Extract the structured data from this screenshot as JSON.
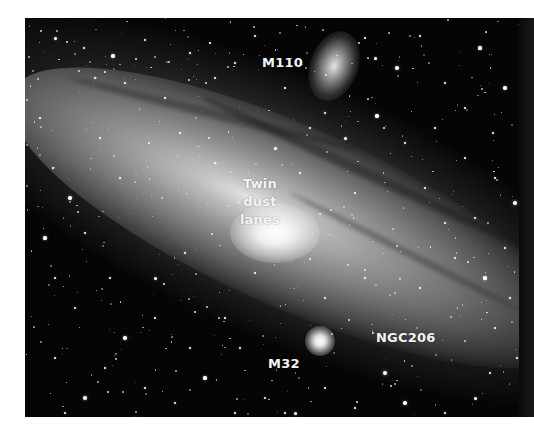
{
  "image": {
    "subject": "Andromeda galaxy (M31) with satellite galaxies",
    "style": "grayscale astrophotograph",
    "colors": {
      "background_page": "#ffffff",
      "sky": "#050505",
      "label_text": "#f4f4f4"
    }
  },
  "labels": {
    "m110": "M110",
    "twin_dust_lanes": [
      "Twin",
      "dust",
      "lanes"
    ],
    "ngc206": "NGC206",
    "m32": "M32"
  },
  "stars": [
    [
      30,
      20,
      1.5
    ],
    [
      59,
      30,
      1.2
    ],
    [
      88,
      38,
      1.8
    ],
    [
      120,
      22,
      1.1
    ],
    [
      165,
      35,
      1.4
    ],
    [
      185,
      25,
      1.0
    ],
    [
      210,
      45,
      1.3
    ],
    [
      230,
      18,
      1.2
    ],
    [
      260,
      70,
      1.1
    ],
    [
      300,
      95,
      1.4
    ],
    [
      350,
      40,
      1.5
    ],
    [
      372,
      50,
      2.0
    ],
    [
      395,
      18,
      1.2
    ],
    [
      420,
      65,
      1.3
    ],
    [
      455,
      30,
      1.6
    ],
    [
      480,
      70,
      1.8
    ],
    [
      468,
      115,
      1.3
    ],
    [
      440,
      140,
      1.1
    ],
    [
      410,
      110,
      1.4
    ],
    [
      380,
      125,
      1.2
    ],
    [
      352,
      98,
      1.6
    ],
    [
      320,
      120,
      1.5
    ],
    [
      490,
      185,
      2.2
    ],
    [
      470,
      160,
      1.2
    ],
    [
      450,
      200,
      1.4
    ],
    [
      480,
      230,
      1.3
    ],
    [
      430,
      240,
      1.1
    ],
    [
      460,
      260,
      1.6
    ],
    [
      485,
      280,
      1.3
    ],
    [
      470,
      310,
      1.2
    ],
    [
      492,
      340,
      1.4
    ],
    [
      450,
      380,
      1.5
    ],
    [
      420,
      395,
      1.3
    ],
    [
      380,
      385,
      1.8
    ],
    [
      360,
      355,
      2.2
    ],
    [
      330,
      390,
      1.3
    ],
    [
      300,
      370,
      1.2
    ],
    [
      270,
      395,
      1.5
    ],
    [
      240,
      380,
      1.3
    ],
    [
      210,
      395,
      1.2
    ],
    [
      180,
      360,
      1.6
    ],
    [
      150,
      385,
      1.3
    ],
    [
      120,
      370,
      1.4
    ],
    [
      100,
      320,
      1.8
    ],
    [
      80,
      350,
      1.2
    ],
    [
      60,
      380,
      2.0
    ],
    [
      40,
      395,
      1.3
    ],
    [
      30,
      340,
      1.2
    ],
    [
      50,
      290,
      1.4
    ],
    [
      30,
      260,
      1.3
    ],
    [
      20,
      220,
      1.6
    ],
    [
      60,
      215,
      1.2
    ],
    [
      45,
      180,
      1.8
    ],
    [
      28,
      150,
      1.3
    ],
    [
      75,
      120,
      1.2
    ],
    [
      100,
      65,
      1.4
    ],
    [
      140,
      80,
      1.1
    ],
    [
      155,
      115,
      1.3
    ],
    [
      190,
      145,
      1.2
    ],
    [
      130,
      260,
      1.5
    ],
    [
      160,
      235,
      1.3
    ],
    [
      200,
      300,
      1.2
    ],
    [
      130,
      300,
      1.1
    ],
    [
      230,
      255,
      1.3
    ],
    [
      300,
      280,
      1.2
    ],
    [
      340,
      260,
      1.4
    ],
    [
      275,
      155,
      1.3
    ],
    [
      330,
      175,
      1.1
    ],
    [
      250,
      130,
      1.5
    ],
    [
      285,
      110,
      1.3
    ],
    [
      400,
      170,
      1.2
    ],
    [
      420,
      205,
      1.3
    ],
    [
      395,
      270,
      1.2
    ],
    [
      190,
      60,
      1.1
    ],
    [
      70,
      60,
      1.3
    ],
    [
      15,
      100,
      1.2
    ],
    [
      95,
      160,
      1.4
    ],
    [
      215,
      330,
      1.3
    ],
    [
      165,
      330,
      1.1
    ],
    [
      85,
      260,
      1.2
    ],
    [
      465,
      355,
      1.3
    ],
    [
      500,
      395,
      1.2
    ],
    [
      505,
      30,
      1.5
    ],
    [
      505,
      120,
      1.2
    ],
    [
      440,
      90,
      1.1
    ],
    [
      340,
      20,
      1.2
    ],
    [
      110,
      400,
      1.3
    ],
    [
      260,
      395,
      1.2
    ]
  ]
}
